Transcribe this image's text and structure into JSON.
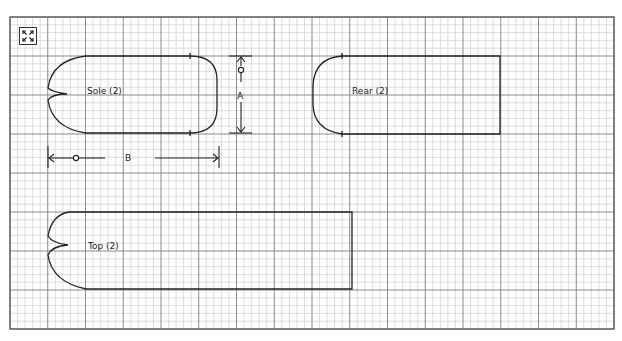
{
  "toolbar": {
    "expand_icon": "expand-arrows-icon"
  },
  "grid": {
    "left": 10,
    "top": 17,
    "right": 614,
    "bottom": 329,
    "major_cols": 16,
    "major_rows": 8,
    "minor_per_major": 5,
    "major_color": "#8a8a8a",
    "minor_color": "#d4d4d4",
    "border_color": "#555555"
  },
  "pieces": [
    {
      "id": "sole",
      "label": "Sole (2)"
    },
    {
      "id": "rear",
      "label": "Rear (2)"
    },
    {
      "id": "top",
      "label": "Top (2)"
    }
  ],
  "dimensions": [
    {
      "id": "A",
      "label": "A"
    },
    {
      "id": "B",
      "label": "B"
    }
  ],
  "colors": {
    "outline": "#222222"
  }
}
